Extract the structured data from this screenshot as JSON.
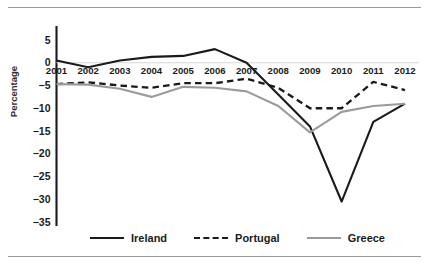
{
  "figure": {
    "y_axis_title": "Percentage"
  },
  "chart_data": {
    "type": "line",
    "title": "",
    "subtitle": "",
    "xlabel": "",
    "ylabel": "Percentage",
    "x": [
      "2001",
      "2002",
      "2003",
      "2004",
      "2005",
      "2006",
      "2007",
      "2008",
      "2009",
      "2010",
      "2011",
      "2012"
    ],
    "categories": [
      "2001",
      "2002",
      "2003",
      "2004",
      "2005",
      "2006",
      "2007",
      "2008",
      "2009",
      "2010",
      "2011",
      "2012"
    ],
    "xlim": [
      "2001",
      "2012"
    ],
    "ylim": [
      -35,
      5
    ],
    "ytick_labels": [
      "5",
      "0",
      "−5",
      "−10",
      "−15",
      "−20",
      "−25",
      "−30",
      "−35"
    ],
    "ytick_values": [
      5,
      0,
      -5,
      -10,
      -15,
      -20,
      -25,
      -30,
      -35
    ],
    "grid": false,
    "zero_line": true,
    "legend_position": "bottom",
    "series": [
      {
        "name": "Ireland",
        "style": "solid",
        "color": "#1a1a1a",
        "values": [
          0.5,
          -1.0,
          0.5,
          1.3,
          1.5,
          3.0,
          0.0,
          -7.0,
          -14.0,
          -30.5,
          -13.0,
          -9.0
        ]
      },
      {
        "name": "Portugal",
        "style": "dashed",
        "color": "#1a1a1a",
        "values": [
          -4.7,
          -4.3,
          -5.0,
          -5.5,
          -4.5,
          -4.5,
          -3.5,
          -5.5,
          -10.0,
          -10.0,
          -4.2,
          -6.0
        ]
      },
      {
        "name": "Greece",
        "style": "solid",
        "color": "#9b9b9b",
        "values": [
          -4.7,
          -4.8,
          -5.7,
          -7.5,
          -5.3,
          -5.5,
          -6.3,
          -9.5,
          -15.3,
          -10.8,
          -9.5,
          -9.0
        ]
      }
    ]
  },
  "legend": {
    "items": [
      {
        "label": "Ireland"
      },
      {
        "label": "Portugal"
      },
      {
        "label": "Greece"
      }
    ]
  }
}
